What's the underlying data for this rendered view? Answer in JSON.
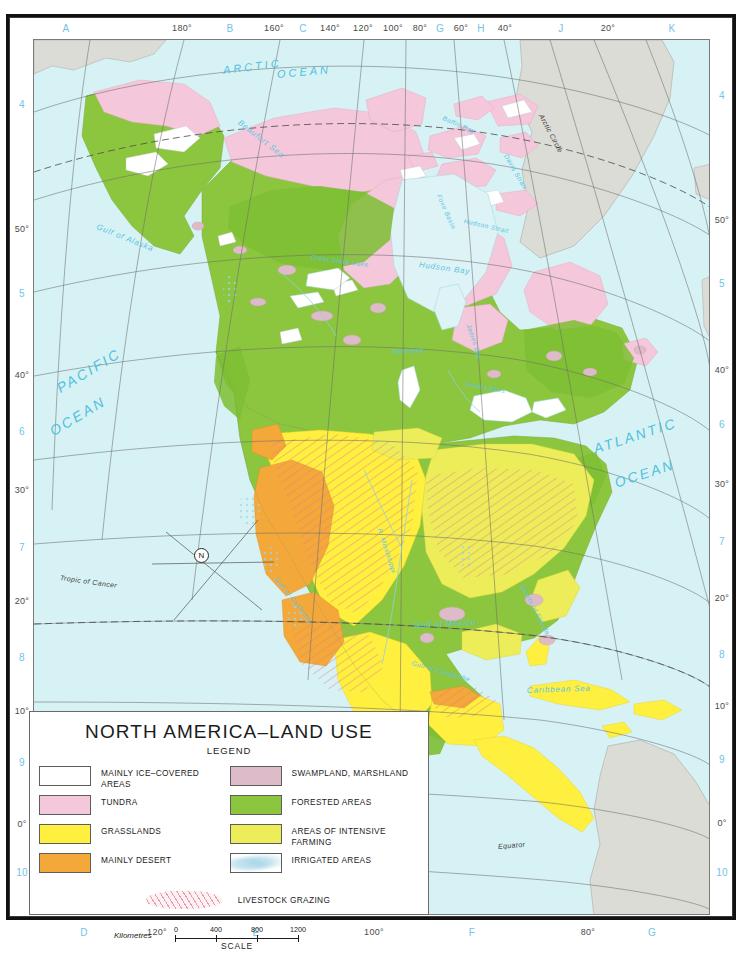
{
  "map": {
    "title": "NORTH AMERICA–LAND USE",
    "legend_heading": "LEGEND",
    "background_ocean_color": "#d7f2f4",
    "land_outside_color": "#dcdcd6"
  },
  "legend": {
    "left_column": [
      {
        "label": "MAINLY ICE–COVERED AREAS",
        "color": "#ffffff",
        "name": "ice-covered"
      },
      {
        "label": "TUNDRA",
        "color": "#f4c7da",
        "name": "tundra"
      },
      {
        "label": "GRASSLANDS",
        "color": "#ffef3f",
        "name": "grasslands"
      },
      {
        "label": "MAINLY DESERT",
        "color": "#f4a83a",
        "name": "desert"
      }
    ],
    "right_column": [
      {
        "label": "SWAMPLAND, MARSHLAND",
        "color": "#debbc9",
        "name": "swampland"
      },
      {
        "label": "FORESTED AREAS",
        "color": "#8cc63f",
        "name": "forested"
      },
      {
        "label": "AREAS OF INTENSIVE FARMING",
        "color": "#eded5a",
        "name": "intensive-farming"
      },
      {
        "label": "IRRIGATED AREAS",
        "color": "#ffffff",
        "name": "irrigated"
      }
    ],
    "grazing_label": "LIVESTOCK GRAZING",
    "scale": {
      "unit_label": "Kilometres",
      "ticks": [
        "0",
        "400",
        "800",
        "1200"
      ],
      "caption": "SCALE"
    }
  },
  "margins": {
    "top": [
      {
        "text": "A",
        "x": 66,
        "type": "grid"
      },
      {
        "text": "180°",
        "x": 182,
        "type": "deg"
      },
      {
        "text": "B",
        "x": 230,
        "type": "grid"
      },
      {
        "text": "160°",
        "x": 274,
        "type": "deg"
      },
      {
        "text": "C",
        "x": 303,
        "type": "grid"
      },
      {
        "text": "140°",
        "x": 330,
        "type": "deg"
      },
      {
        "text": "120°",
        "x": 363,
        "type": "deg"
      },
      {
        "text": "100°",
        "x": 393,
        "type": "deg"
      },
      {
        "text": "80°",
        "x": 420,
        "type": "deg"
      },
      {
        "text": "G",
        "x": 440,
        "type": "grid"
      },
      {
        "text": "60°",
        "x": 461,
        "type": "deg"
      },
      {
        "text": "H",
        "x": 481,
        "type": "grid"
      },
      {
        "text": "40°",
        "x": 505,
        "type": "deg"
      },
      {
        "text": "J",
        "x": 561,
        "type": "grid"
      },
      {
        "text": "20°",
        "x": 608,
        "type": "deg"
      },
      {
        "text": "K",
        "x": 672,
        "type": "grid"
      }
    ],
    "bottom": [
      {
        "text": "D",
        "x": 84,
        "type": "grid"
      },
      {
        "text": "120°",
        "x": 157,
        "type": "deg"
      },
      {
        "text": "E",
        "x": 256,
        "type": "grid"
      },
      {
        "text": "100°",
        "x": 374,
        "type": "deg"
      },
      {
        "text": "F",
        "x": 472,
        "type": "grid"
      },
      {
        "text": "80°",
        "x": 588,
        "type": "deg"
      },
      {
        "text": "G",
        "x": 652,
        "type": "grid"
      }
    ],
    "left": [
      {
        "text": "4",
        "y": 104,
        "type": "grid"
      },
      {
        "text": "50°",
        "y": 229,
        "type": "deg"
      },
      {
        "text": "5",
        "y": 293,
        "type": "grid"
      },
      {
        "text": "40°",
        "y": 375,
        "type": "deg"
      },
      {
        "text": "6",
        "y": 431,
        "type": "grid"
      },
      {
        "text": "30°",
        "y": 490,
        "type": "deg"
      },
      {
        "text": "7",
        "y": 547,
        "type": "grid"
      },
      {
        "text": "20°",
        "y": 601,
        "type": "deg"
      },
      {
        "text": "8",
        "y": 657,
        "type": "grid"
      },
      {
        "text": "10°",
        "y": 711,
        "type": "deg"
      },
      {
        "text": "9",
        "y": 762,
        "type": "grid"
      },
      {
        "text": "0°",
        "y": 824,
        "type": "deg"
      },
      {
        "text": "10",
        "y": 872,
        "type": "grid"
      }
    ],
    "right": [
      {
        "text": "4",
        "y": 95,
        "type": "grid"
      },
      {
        "text": "50°",
        "y": 220,
        "type": "deg"
      },
      {
        "text": "5",
        "y": 283,
        "type": "grid"
      },
      {
        "text": "40°",
        "y": 370,
        "type": "deg"
      },
      {
        "text": "6",
        "y": 424,
        "type": "grid"
      },
      {
        "text": "30°",
        "y": 484,
        "type": "deg"
      },
      {
        "text": "7",
        "y": 541,
        "type": "grid"
      },
      {
        "text": "20°",
        "y": 598,
        "type": "deg"
      },
      {
        "text": "8",
        "y": 654,
        "type": "grid"
      },
      {
        "text": "10°",
        "y": 706,
        "type": "deg"
      },
      {
        "text": "9",
        "y": 759,
        "type": "grid"
      },
      {
        "text": "0°",
        "y": 823,
        "type": "deg"
      },
      {
        "text": "10",
        "y": 872,
        "type": "grid"
      }
    ]
  },
  "map_labels": {
    "oceans": [
      {
        "text": "ARCTIC",
        "x": 222,
        "y": 63,
        "rot": -8,
        "name": "arctic-ocean-label"
      },
      {
        "text": "OCEAN",
        "x": 276,
        "y": 67,
        "rot": -6,
        "name": "arctic-ocean-label-2"
      },
      {
        "text": "PACIFIC",
        "x": 57,
        "y": 380,
        "rot": -31,
        "name": "pacific-ocean-label"
      },
      {
        "text": "OCEAN",
        "x": 50,
        "y": 423,
        "rot": -31,
        "name": "pacific-ocean-label-2"
      },
      {
        "text": "ATLANTIC",
        "x": 593,
        "y": 440,
        "rot": -18,
        "name": "atlantic-ocean-label"
      },
      {
        "text": "OCEAN",
        "x": 614,
        "y": 474,
        "rot": -18,
        "name": "atlantic-ocean-label-2"
      }
    ],
    "seas": [
      {
        "text": "Beaufort Sea",
        "x": 238,
        "y": 116,
        "rot": 38,
        "name": "beaufort-sea-label"
      },
      {
        "text": "Gulf of Alaska",
        "x": 96,
        "y": 221,
        "rot": 22,
        "name": "gulf-of-alaska-label"
      },
      {
        "text": "Baffin Bay",
        "x": 442,
        "y": 113,
        "rot": 24,
        "name": "baffin-bay-label"
      },
      {
        "text": "Davis Strait",
        "x": 505,
        "y": 150,
        "rot": 60,
        "name": "davis-strait-label"
      },
      {
        "text": "Hudson Strait",
        "x": 463,
        "y": 216,
        "rot": 13,
        "name": "hudson-strait-label"
      },
      {
        "text": "Foxe Basin",
        "x": 438,
        "y": 190,
        "rot": 66,
        "name": "foxe-basin-label"
      },
      {
        "text": "Hudson Bay",
        "x": 418,
        "y": 259,
        "rot": 8,
        "name": "hudson-bay-label"
      },
      {
        "text": "James Bay",
        "x": 468,
        "y": 320,
        "rot": 72,
        "name": "james-bay-label"
      },
      {
        "text": "Great Slave Lake",
        "x": 310,
        "y": 252,
        "rot": 8,
        "name": "great-slave-lake-label"
      },
      {
        "text": "Winnipeg",
        "x": 392,
        "y": 347,
        "rot": -4,
        "name": "winnipeg-label"
      },
      {
        "text": "Great Lakes",
        "x": 464,
        "y": 379,
        "rot": 10,
        "name": "great-lakes-label"
      },
      {
        "text": "Gulf of Mexico",
        "x": 413,
        "y": 620,
        "rot": -3,
        "name": "gulf-of-mexico-label"
      },
      {
        "text": "Gulf of Campeche",
        "x": 411,
        "y": 658,
        "rot": 16,
        "name": "gulf-of-campeche-label"
      },
      {
        "text": "Caribbean  Sea",
        "x": 526,
        "y": 685,
        "rot": -2,
        "name": "caribbean-sea-label"
      },
      {
        "text": "Straits of Florida",
        "x": 521,
        "y": 580,
        "rot": 62,
        "name": "straits-of-florida-label"
      },
      {
        "text": "R. Mississippi",
        "x": 379,
        "y": 524,
        "rot": 72,
        "name": "mississippi-river-label"
      },
      {
        "text": "Gulf of California",
        "x": 275,
        "y": 573,
        "rot": 52,
        "name": "gulf-of-california-label"
      }
    ],
    "geo_lines": [
      {
        "text": "Arctic Circle",
        "x": 540,
        "y": 110,
        "rot": 62,
        "name": "arctic-circle-label"
      },
      {
        "text": "Tropic of Cancer",
        "x": 59,
        "y": 573,
        "rot": 8,
        "name": "tropic-of-cancer-label"
      },
      {
        "text": "Equator",
        "x": 497,
        "y": 842,
        "rot": -5,
        "name": "equator-label"
      }
    ],
    "compass": {
      "text": "N",
      "x": 193,
      "y": 547,
      "name": "compass-rose"
    }
  }
}
